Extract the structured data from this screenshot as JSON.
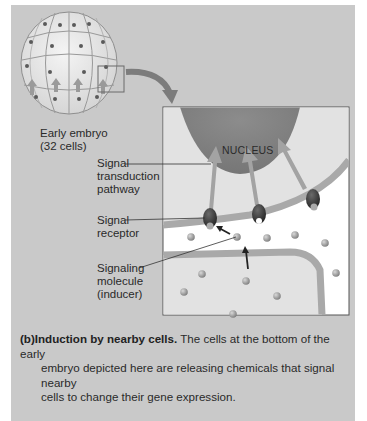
{
  "figure": {
    "embryo_label": {
      "line1": "Early embryo",
      "line2": "(32 cells)"
    },
    "nucleus_label": "NUCLEUS",
    "callouts": [
      {
        "lines": [
          "Signal",
          "transduction",
          "pathway"
        ]
      },
      {
        "lines": [
          "Signal",
          "receptor"
        ]
      },
      {
        "lines": [
          "Signaling",
          "molecule",
          "(inducer)"
        ]
      }
    ],
    "caption": {
      "tag": "(b)",
      "title": "Induction by nearby cells.",
      "text_line1": " The cells at the bottom of the early",
      "text_line2": "embryo depicted here are releasing chemicals that signal nearby",
      "text_line3": "cells to change their gene expression."
    },
    "colors": {
      "panel_bg": "#c9c9c9",
      "cell_fill": "#e6e6e6",
      "nucleus": "#8a8a8a",
      "membrane": "#a8a8a8",
      "arrow": "#9e9e9e",
      "receptor": "#3a3a3a",
      "molecule": "#9a9a9a"
    }
  }
}
